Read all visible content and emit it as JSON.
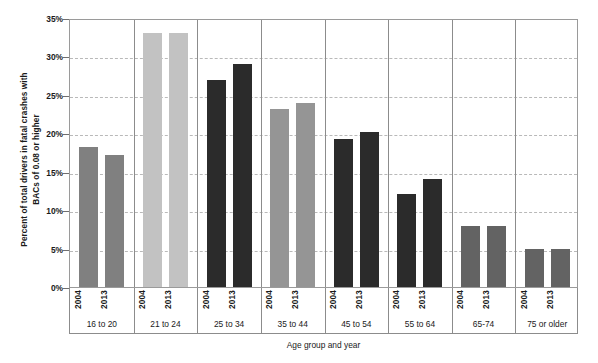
{
  "chart_data": {
    "type": "bar",
    "title": "",
    "xlabel": "Age group and year",
    "ylabel": "Percent of total drivers in fatal crashes with\nBACs of 0.08 or higher",
    "ylim": [
      0,
      35
    ],
    "ytick_step": 5,
    "ytick_labels": [
      "0%",
      "5%",
      "10%",
      "15%",
      "20%",
      "25%",
      "30%",
      "35%"
    ],
    "ytick_values": [
      0,
      5,
      10,
      15,
      20,
      25,
      30,
      35
    ],
    "grid": "horizontal-dashed",
    "legend": "none",
    "categories": [
      "16 to 20",
      "21 to 24",
      "25 to 34",
      "35 to 44",
      "45 to 54",
      "55 to 64",
      "65-74",
      "75 or older"
    ],
    "series": [
      {
        "name": "2004",
        "values": [
          18.2,
          33.0,
          27.0,
          23.2,
          19.2,
          12.1,
          8.0,
          5.0
        ]
      },
      {
        "name": "2013",
        "values": [
          17.2,
          33.0,
          29.0,
          24.0,
          20.2,
          14.0,
          8.0,
          5.0
        ]
      }
    ],
    "groups": [
      {
        "label": "16 to 20",
        "color": "#808080",
        "bars": [
          {
            "year": "2004",
            "value": 18.2
          },
          {
            "year": "2013",
            "value": 17.2
          }
        ]
      },
      {
        "label": "21 to 24",
        "color": "#c2c2c2",
        "bars": [
          {
            "year": "2004",
            "value": 33.0
          },
          {
            "year": "2013",
            "value": 33.0
          }
        ]
      },
      {
        "label": "25 to 34",
        "color": "#2b2b2b",
        "bars": [
          {
            "year": "2004",
            "value": 27.0
          },
          {
            "year": "2013",
            "value": 29.0
          }
        ]
      },
      {
        "label": "35 to 44",
        "color": "#959595",
        "bars": [
          {
            "year": "2004",
            "value": 23.2
          },
          {
            "year": "2013",
            "value": 24.0
          }
        ]
      },
      {
        "label": "45 to 54",
        "color": "#2b2b2b",
        "bars": [
          {
            "year": "2004",
            "value": 19.2
          },
          {
            "year": "2013",
            "value": 20.2
          }
        ]
      },
      {
        "label": "55 to 64",
        "color": "#2b2b2b",
        "bars": [
          {
            "year": "2004",
            "value": 12.1
          },
          {
            "year": "2013",
            "value": 14.0
          }
        ]
      },
      {
        "label": "65-74",
        "color": "#636363",
        "bars": [
          {
            "year": "2004",
            "value": 8.0
          },
          {
            "year": "2013",
            "value": 8.0
          }
        ]
      },
      {
        "label": "75 or older",
        "color": "#636363",
        "bars": [
          {
            "year": "2004",
            "value": 5.0
          },
          {
            "year": "2013",
            "value": 5.0
          }
        ]
      }
    ],
    "colors": {
      "medium_gray": "#808080",
      "light_gray": "#c2c2c2",
      "dark_gray": "#2b2b2b",
      "mid_light_gray": "#959595",
      "slate_gray": "#636363",
      "gridline": "#b9b9b9",
      "axis": "#8c8c8c",
      "text": "#1a1a1a",
      "background": "#ffffff"
    }
  }
}
